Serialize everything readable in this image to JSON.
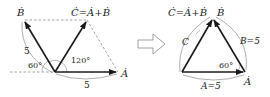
{
  "left_diagram": {
    "vector_a_label": "Ȧ",
    "vector_b_label": "Ḃ",
    "vector_c_label": "Ċ=Ȧ+Ḃ",
    "magnitude_a": "5",
    "magnitude_b": "5",
    "angle_b_horizontal": "60°",
    "angle_a_b": "120°"
  },
  "transition_arrow": "right-arrow",
  "right_diagram": {
    "vector_c_label": "Ċ=Ȧ+Ḃ",
    "vector_b_label": "Ḃ",
    "vector_a_label": "Ȧ",
    "side_c_label": "C",
    "side_b_label": "B=5",
    "side_a_label": "A=5",
    "angle_label": "60°"
  },
  "colors": {
    "vector": "#1a1a1a",
    "dashed": "#888888",
    "arc": "#999999"
  }
}
